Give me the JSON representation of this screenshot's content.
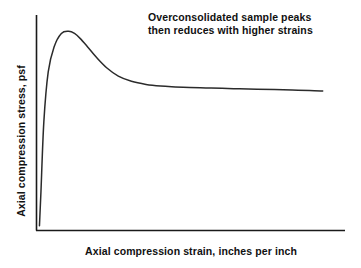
{
  "figure": {
    "background_color": "#ffffff",
    "axis_color": "#1a1a1a",
    "curve_color": "#2b2b2b"
  },
  "annotation": {
    "line1": "Overconsolidated sample peaks",
    "line2": "then reduces with higher strains"
  },
  "chart_data": {
    "type": "line",
    "title": "",
    "subtitle": "",
    "xlabel": "Axial compression strain, inches per inch",
    "ylabel": "Axial compression stress, psf",
    "xlim": [
      0,
      1
    ],
    "ylim": [
      0,
      1
    ],
    "grid": false,
    "legend": false,
    "axis_ticks": false,
    "tick_labels": {
      "x": [],
      "y": []
    },
    "annotations": [
      {
        "text": "Overconsolidated sample peaks then reduces with higher strains",
        "x": 0.38,
        "y": 0.95
      }
    ],
    "series": [
      {
        "name": "Overconsolidated sample stress-strain",
        "x": [
          0.005,
          0.01,
          0.02,
          0.035,
          0.055,
          0.08,
          0.105,
          0.125,
          0.145,
          0.17,
          0.2,
          0.235,
          0.275,
          0.32,
          0.37,
          0.42,
          0.47,
          0.52,
          0.575,
          0.63,
          0.69,
          0.75,
          0.81,
          0.87,
          0.93,
          0.975
        ],
        "y": [
          0.02,
          0.18,
          0.52,
          0.76,
          0.88,
          0.945,
          0.955,
          0.945,
          0.92,
          0.88,
          0.83,
          0.78,
          0.74,
          0.715,
          0.7,
          0.692,
          0.688,
          0.685,
          0.683,
          0.681,
          0.679,
          0.677,
          0.675,
          0.673,
          0.671,
          0.668
        ],
        "peak": {
          "x": 0.105,
          "y": 0.955
        },
        "residual_plateau": 0.67
      }
    ]
  }
}
